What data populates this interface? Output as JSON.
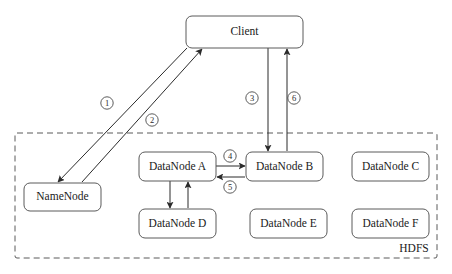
{
  "diagram": {
    "boundary": {
      "label": "HDFS",
      "style": "dashed",
      "x": 15,
      "y": 133,
      "width": 422,
      "height": 125,
      "label_x": 414,
      "label_y": 249
    },
    "colors": {
      "background": "#ffffff",
      "box_stroke": "#5a5a5a",
      "line_stroke": "#2b2b2b",
      "text": "#1a1a1a",
      "boundary_stroke": "#5a5a5a"
    },
    "nodes": [
      {
        "id": "client",
        "label": "Client",
        "x": 186,
        "y": 16,
        "width": 117,
        "height": 32,
        "inside_boundary": false
      },
      {
        "id": "namenode",
        "label": "NameNode",
        "x": 24,
        "y": 183,
        "width": 77,
        "height": 28,
        "inside_boundary": true
      },
      {
        "id": "datanodeA",
        "label": "DataNode A",
        "x": 139,
        "y": 152,
        "width": 77,
        "height": 29,
        "inside_boundary": true
      },
      {
        "id": "datanodeB",
        "label": "DataNode B",
        "x": 246,
        "y": 152,
        "width": 77,
        "height": 29,
        "inside_boundary": true
      },
      {
        "id": "datanodeC",
        "label": "DataNode C",
        "x": 352,
        "y": 152,
        "width": 77,
        "height": 29,
        "inside_boundary": true
      },
      {
        "id": "datanodeD",
        "label": "DataNode D",
        "x": 139,
        "y": 209,
        "width": 77,
        "height": 29,
        "inside_boundary": true
      },
      {
        "id": "datanodeE",
        "label": "DataNode E",
        "x": 250,
        "y": 209,
        "width": 77,
        "height": 29,
        "inside_boundary": true
      },
      {
        "id": "datanodeF",
        "label": "DataNode F",
        "x": 352,
        "y": 209,
        "width": 77,
        "height": 29,
        "inside_boundary": true
      }
    ],
    "edges": [
      {
        "id": "edge-1",
        "step": "1",
        "step_glyph": "①",
        "from": "client",
        "to": "namenode",
        "x1": 187,
        "y1": 48,
        "x2": 58,
        "y2": 182,
        "arrow": "end",
        "label_x": 107,
        "label_y": 103
      },
      {
        "id": "edge-2",
        "step": "2",
        "step_glyph": "②",
        "from": "namenode",
        "to": "client",
        "x1": 82,
        "y1": 182,
        "x2": 202,
        "y2": 49,
        "arrow": "end",
        "label_x": 152,
        "label_y": 120
      },
      {
        "id": "edge-3",
        "step": "3",
        "step_glyph": "③",
        "from": "client",
        "to": "datanodeB",
        "x1": 268,
        "y1": 48,
        "x2": 268,
        "y2": 151,
        "arrow": "end",
        "label_x": 252,
        "label_y": 98
      },
      {
        "id": "edge-6",
        "step": "6",
        "step_glyph": "⑥",
        "from": "datanodeB",
        "to": "client",
        "x1": 287,
        "y1": 151,
        "x2": 287,
        "y2": 49,
        "arrow": "end",
        "label_x": 294,
        "label_y": 98
      },
      {
        "id": "edge-4",
        "step": "4",
        "step_glyph": "④",
        "from": "datanodeA",
        "to": "datanodeB",
        "x1": 216,
        "y1": 166,
        "x2": 245,
        "y2": 166,
        "arrow": "end",
        "label_x": 230,
        "label_y": 156
      },
      {
        "id": "edge-5",
        "step": "5",
        "step_glyph": "⑤",
        "from": "datanodeB",
        "to": "datanodeA",
        "x1": 245,
        "y1": 177,
        "x2": 217,
        "y2": 177,
        "arrow": "end",
        "label_x": 230,
        "label_y": 187
      },
      {
        "id": "edge-a-to-d",
        "step": "",
        "step_glyph": "",
        "from": "datanodeA",
        "to": "datanodeD",
        "x1": 170,
        "y1": 181,
        "x2": 170,
        "y2": 208,
        "arrow": "end",
        "label_x": null,
        "label_y": null
      },
      {
        "id": "edge-d-to-a",
        "step": "",
        "step_glyph": "",
        "from": "datanodeD",
        "to": "datanodeA",
        "x1": 188,
        "y1": 208,
        "x2": 188,
        "y2": 182,
        "arrow": "end",
        "label_x": null,
        "label_y": null
      }
    ]
  }
}
